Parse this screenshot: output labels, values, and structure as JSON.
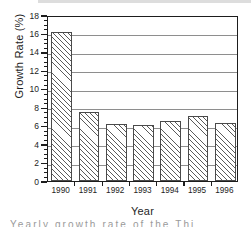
{
  "chart_data": {
    "type": "bar",
    "title": "",
    "xlabel": "Year",
    "ylabel": "Growth Rate (%)",
    "categories": [
      "1990",
      "1991",
      "1992",
      "1993",
      "1994",
      "1995",
      "1996"
    ],
    "values": [
      16.2,
      7.5,
      6.2,
      6.1,
      6.5,
      7.0,
      6.3
    ],
    "series": [
      {
        "name": "Growth Rate",
        "values": [
          16.2,
          7.5,
          6.2,
          6.1,
          6.5,
          7.0,
          6.3
        ]
      }
    ],
    "ylim": [
      0,
      18
    ],
    "xlim_categories": 7,
    "y_major_ticks": [
      0,
      2,
      4,
      6,
      8,
      10,
      12,
      14,
      16,
      18
    ],
    "y_minor_tick_interval": 0.5,
    "y_tick_labels": [
      "0",
      "2",
      "4",
      "6",
      "8",
      "10",
      "12",
      "14",
      "16",
      "18"
    ],
    "gridlines": {
      "horizontal": true,
      "vertical": false,
      "values": [
        2,
        4,
        6,
        8,
        10,
        12,
        14,
        16
      ]
    },
    "legend": {
      "visible": false,
      "position": "none",
      "entries": []
    },
    "bar_style": {
      "fill": "diagonal-hatch",
      "hatch_color": "#5a5a5a",
      "background_color": "#ffffff",
      "edge_color": "#4a4a4a"
    },
    "frame": {
      "color": "#1d1d1d",
      "visible": true
    },
    "annotations": []
  },
  "caption": {
    "cut_off_text": "Yearly growth rate of the       Thi"
  }
}
